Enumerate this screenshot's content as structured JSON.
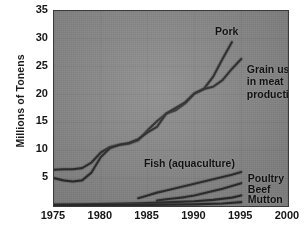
{
  "chart_data": {
    "type": "line",
    "title": "",
    "xlabel": "",
    "ylabel": "Millions of Tonens",
    "xlim": [
      1975,
      2000
    ],
    "ylim": [
      0,
      35
    ],
    "xticks": [
      1975,
      1980,
      1985,
      1990,
      1995,
      2000
    ],
    "yticks": [
      5,
      10,
      15,
      20,
      25,
      30,
      35
    ],
    "grid": true,
    "legend_position": "inline-annotations",
    "series": [
      {
        "name": "Pork",
        "x": [
          1975,
          1976,
          1977,
          1978,
          1979,
          1980,
          1981,
          1982,
          1983,
          1984,
          1985,
          1986,
          1987,
          1988,
          1989,
          1990,
          1991,
          1992,
          1993,
          1994
        ],
        "values": [
          6.5,
          6.6,
          6.6,
          6.8,
          7.8,
          9.6,
          10.6,
          11.0,
          11.2,
          11.8,
          13.6,
          15.2,
          16.6,
          17.2,
          18.4,
          20.2,
          21.0,
          23.2,
          26.4,
          29.4
        ]
      },
      {
        "name": "Grain used in meat production",
        "x": [
          1975,
          1976,
          1977,
          1978,
          1979,
          1980,
          1981,
          1982,
          1983,
          1984,
          1985,
          1986,
          1987,
          1988,
          1989,
          1990,
          1991,
          1992,
          1993,
          1994,
          1995
        ],
        "values": [
          5.0,
          4.6,
          4.4,
          4.6,
          6.0,
          8.8,
          10.4,
          11.0,
          11.3,
          12.0,
          13.2,
          14.2,
          16.6,
          17.6,
          18.6,
          20.2,
          21.0,
          21.4,
          22.6,
          24.6,
          26.4
        ]
      },
      {
        "name": "Fish (aquaculture)",
        "x": [
          1984,
          1985,
          1986,
          1987,
          1988,
          1989,
          1990,
          1991,
          1992,
          1993,
          1994,
          1995
        ],
        "values": [
          1.4,
          1.9,
          2.4,
          2.8,
          3.2,
          3.6,
          4.0,
          4.4,
          4.8,
          5.2,
          5.6,
          6.1
        ]
      },
      {
        "name": "Poultry",
        "x": [
          1986,
          1987,
          1988,
          1989,
          1990,
          1991,
          1992,
          1993,
          1994,
          1995
        ],
        "values": [
          1.0,
          1.2,
          1.4,
          1.6,
          1.9,
          2.3,
          2.7,
          3.1,
          3.6,
          4.1
        ]
      },
      {
        "name": "Beef",
        "x": [
          1975,
          1978,
          1981,
          1984,
          1987,
          1990,
          1992,
          1994,
          1995
        ],
        "values": [
          0.25,
          0.3,
          0.4,
          0.5,
          0.65,
          0.85,
          1.1,
          1.5,
          1.9
        ]
      },
      {
        "name": "Mutton",
        "x": [
          1975,
          1980,
          1985,
          1990,
          1993,
          1995
        ],
        "values": [
          0.12,
          0.15,
          0.2,
          0.3,
          0.45,
          0.7
        ]
      }
    ],
    "annotations": [
      {
        "text": "Pork",
        "x": 1992.2,
        "y": 31.3
      },
      {
        "text": "Grain used",
        "x": 1995.6,
        "y": 24.4
      },
      {
        "text": "in meat",
        "x": 1995.6,
        "y": 22.2
      },
      {
        "text": "production",
        "x": 1995.6,
        "y": 20.0
      },
      {
        "text": "Fish (aquaculture)",
        "x": 1984.6,
        "y": 7.6
      },
      {
        "text": "Poultry",
        "x": 1995.7,
        "y": 4.9
      },
      {
        "text": "Beef",
        "x": 1995.7,
        "y": 2.8
      },
      {
        "text": "Mutton",
        "x": 1995.7,
        "y": 1.1
      }
    ]
  },
  "colors": {
    "plot_background": "#8a8a8a",
    "frame": "#3a3a3a",
    "line": "#2b2b2b",
    "grid": "#7a7a7a",
    "text": "#161616",
    "page_background": "#ffffff"
  }
}
